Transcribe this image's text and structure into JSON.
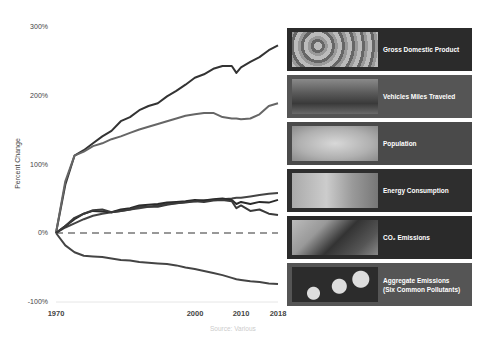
{
  "chart_data": {
    "type": "line",
    "title": "",
    "xlabel": "",
    "ylabel": "Percent Change",
    "source": "Source: Various",
    "x_ticks": [
      "1970",
      "2000",
      "2010",
      "2018"
    ],
    "y_ticks": [
      "300%",
      "200%",
      "100%",
      "0%",
      "-100%"
    ],
    "ylim": [
      -100,
      300
    ],
    "xlim": [
      1970,
      2018
    ],
    "grid": false,
    "baseline": {
      "value": 0,
      "style": "dashed"
    },
    "legend_position": "right",
    "x": [
      1970,
      1972,
      1974,
      1976,
      1978,
      1980,
      1982,
      1984,
      1986,
      1988,
      1990,
      1992,
      1994,
      1996,
      1998,
      2000,
      2002,
      2004,
      2006,
      2008,
      2009,
      2010,
      2012,
      2014,
      2016,
      2018
    ],
    "series": [
      {
        "name": "Gross Domestic Product",
        "color": "#333333",
        "values": [
          0,
          70,
          112,
          120,
          130,
          140,
          148,
          162,
          168,
          178,
          184,
          188,
          198,
          206,
          215,
          225,
          230,
          238,
          242,
          242,
          232,
          240,
          248,
          255,
          265,
          272
        ]
      },
      {
        "name": "Vehicles Miles Traveled",
        "color": "#666666",
        "values": [
          0,
          75,
          112,
          118,
          126,
          130,
          136,
          140,
          145,
          150,
          154,
          158,
          162,
          166,
          170,
          172,
          174,
          174,
          168,
          166,
          166,
          165,
          166,
          172,
          184,
          188
        ]
      },
      {
        "name": "Population",
        "color": "#444444",
        "values": [
          0,
          8,
          14,
          20,
          25,
          28,
          30,
          32,
          34,
          36,
          38,
          40,
          42,
          43,
          45,
          46,
          47,
          48,
          49,
          50,
          51,
          51,
          53,
          55,
          57,
          58
        ]
      },
      {
        "name": "Energy Consumption",
        "color": "#2a2a2a",
        "values": [
          0,
          10,
          20,
          28,
          32,
          31,
          30,
          34,
          36,
          40,
          41,
          42,
          44,
          45,
          46,
          48,
          47,
          49,
          50,
          48,
          42,
          45,
          42,
          45,
          44,
          48
        ]
      },
      {
        "name": "CO2 Emissions",
        "color": "#3a3a3a",
        "values": [
          0,
          10,
          22,
          28,
          33,
          34,
          30,
          32,
          34,
          38,
          38,
          38,
          41,
          43,
          44,
          46,
          45,
          47,
          48,
          46,
          36,
          40,
          32,
          34,
          28,
          26
        ]
      },
      {
        "name": "Aggregate Emissions (Six Common Pollutants)",
        "color": "#444444",
        "values": [
          0,
          -18,
          -28,
          -33,
          -34,
          -35,
          -37,
          -39,
          -40,
          -42,
          -43,
          -44,
          -45,
          -47,
          -50,
          -52,
          -55,
          -58,
          -61,
          -65,
          -67,
          -68,
          -70,
          -71,
          -73,
          -74
        ]
      }
    ]
  },
  "legend": {
    "items": [
      {
        "label": "Gross Domestic Product",
        "bg": "#2b2b2b"
      },
      {
        "label": "Vehicles Miles Traveled",
        "bg": "#555555"
      },
      {
        "label": "Population",
        "bg": "#4a4a4a"
      },
      {
        "label": "Energy Consumption",
        "bg": "#2e2e2e"
      },
      {
        "label": "CO₂ Emissions",
        "bg": "#2a2a2a"
      },
      {
        "label": "Aggregate Emissions (Six Common Pollutants)",
        "bg": "#555555"
      }
    ]
  }
}
